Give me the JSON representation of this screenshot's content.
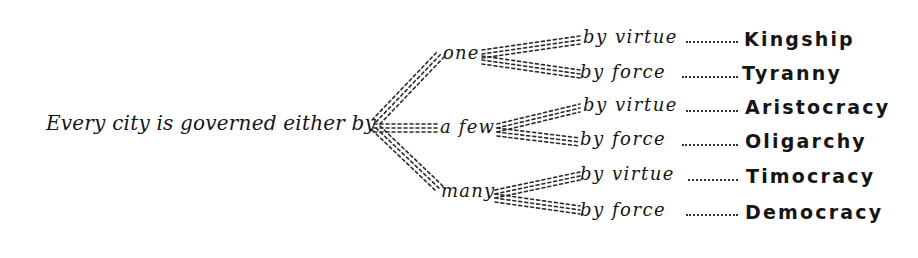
{
  "diagram": {
    "type": "tree",
    "style": "handwritten calligraphy, dashed connector lines",
    "root": {
      "label": "Every city is governed either by"
    },
    "branches": [
      {
        "label": "one",
        "children": [
          {
            "mode": "by virtue",
            "result": "Kingship"
          },
          {
            "mode": "by force",
            "result": "Tyranny"
          }
        ]
      },
      {
        "label": "a few",
        "children": [
          {
            "mode": "by virtue",
            "result": "Aristocracy"
          },
          {
            "mode": "by force",
            "result": "Oligarchy"
          }
        ]
      },
      {
        "label": "many",
        "children": [
          {
            "mode": "by virtue",
            "result": "Timocracy"
          },
          {
            "mode": "by force",
            "result": "Democracy"
          }
        ]
      }
    ],
    "colors": {
      "ink": "#151515",
      "background": "#ffffff"
    }
  }
}
